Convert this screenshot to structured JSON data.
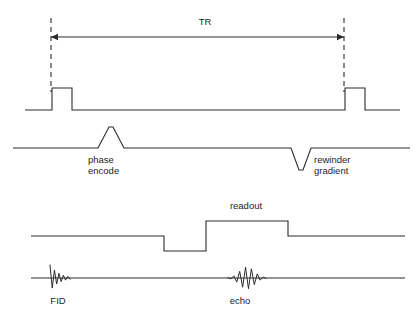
{
  "diagram": {
    "type": "pulse-sequence-timing-diagram",
    "background_color": "#ffffff",
    "line_color": "#2b2b2b",
    "canvas": {
      "width": 418,
      "height": 314
    }
  },
  "labels": {
    "tr": "TR",
    "phase_encode_line1": "phase",
    "phase_encode_line2": "encode",
    "rewinder_line1": "rewinder",
    "rewinder_line2": "gradient",
    "readout": "readout",
    "fid": "FID",
    "echo": "echo"
  },
  "chart_data": {
    "type": "line",
    "xlabel": "time",
    "ylabel": "",
    "grid": false,
    "legend": "none",
    "axis_ranges": {
      "x": [
        0,
        418
      ],
      "y": [
        0,
        314
      ]
    },
    "annotations": [
      {
        "name": "tr-interval",
        "text": "TR",
        "x": 205,
        "y": 22,
        "span_x": [
          51,
          344
        ]
      },
      {
        "name": "phase-encode-label",
        "text": "phase encode",
        "x": 88,
        "y": 160
      },
      {
        "name": "rewinder-label",
        "text": "rewinder gradient",
        "x": 314,
        "y": 160
      },
      {
        "name": "readout-label",
        "text": "readout",
        "x": 246,
        "y": 206
      },
      {
        "name": "fid-label",
        "text": "FID",
        "x": 58,
        "y": 301
      },
      {
        "name": "echo-label",
        "text": "echo",
        "x": 240,
        "y": 301
      }
    ],
    "series": [
      {
        "name": "rf-channel",
        "baseline_y": 110,
        "x_start": 25,
        "x_end": 400,
        "points": [
          [
            25,
            110
          ],
          [
            52,
            110
          ],
          [
            52,
            88
          ],
          [
            72,
            88
          ],
          [
            72,
            110
          ],
          [
            345,
            110
          ],
          [
            345,
            88
          ],
          [
            365,
            88
          ],
          [
            365,
            110
          ],
          [
            400,
            110
          ]
        ]
      },
      {
        "name": "phase-encode-channel",
        "baseline_y": 148,
        "x_start": 13,
        "x_end": 410,
        "points": [
          [
            13,
            148
          ],
          [
            98,
            148
          ],
          [
            109,
            127
          ],
          [
            113,
            127
          ],
          [
            124,
            148
          ],
          [
            291,
            148
          ],
          [
            299,
            170
          ],
          [
            303,
            170
          ],
          [
            311,
            148
          ],
          [
            410,
            148
          ]
        ]
      },
      {
        "name": "readout-channel",
        "baseline_y": 236,
        "x_start": 31,
        "x_end": 405,
        "points": [
          [
            31,
            236
          ],
          [
            164,
            236
          ],
          [
            164,
            251
          ],
          [
            206,
            251
          ],
          [
            206,
            221
          ],
          [
            288,
            221
          ],
          [
            288,
            236
          ],
          [
            405,
            236
          ]
        ]
      },
      {
        "name": "signal-channel-baseline",
        "baseline_y": 278,
        "x_start": 31,
        "x_end": 405
      }
    ],
    "signals": [
      {
        "name": "fid-signal",
        "center_x": 55,
        "center_y": 278,
        "shape": "decaying-oscillation",
        "peak_amplitude": 13,
        "n_lobes": 9,
        "span_x": [
          50,
          70
        ]
      },
      {
        "name": "echo-signal",
        "center_x": 247,
        "center_y": 278,
        "shape": "symmetric-growing-decaying-oscillation",
        "peak_amplitude": 11,
        "n_lobes": 13,
        "span_x": [
          228,
          266
        ]
      }
    ],
    "markers": [
      {
        "name": "left-dashed-marker",
        "x": 51,
        "y_top": 18,
        "y_bottom": 92
      },
      {
        "name": "right-dashed-marker",
        "x": 344,
        "y_top": 18,
        "y_bottom": 92
      }
    ]
  }
}
